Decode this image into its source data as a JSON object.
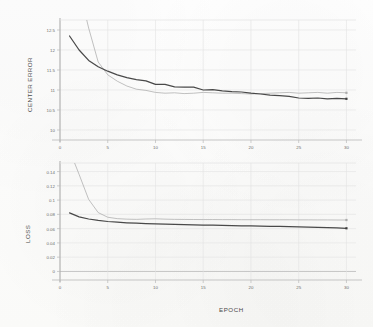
{
  "figure": {
    "background_color": "#fdfdfc",
    "grid_color": "#e3e3e3",
    "axis_color": "#b9b9b9",
    "series_colors": {
      "dark": "#3a3a3a",
      "light": "#a9a9a9"
    }
  },
  "top_chart": {
    "ylabel": "CENTER ERROR",
    "xlabel": "EPOCH",
    "ytick_labels": [
      "12.5",
      "12",
      "11.5",
      "11",
      "10.5",
      "10"
    ],
    "xtick_labels": [
      "0",
      "5",
      "10",
      "15",
      "20",
      "25",
      "30"
    ]
  },
  "bottom_chart": {
    "ylabel": "LOSS",
    "xlabel": "EPOCH",
    "ytick_labels": [
      "0.14",
      "0.12",
      "0.1",
      "0.08",
      "0.06",
      "0.04",
      "0.02",
      "0"
    ],
    "xtick_labels": [
      "0",
      "5",
      "10",
      "15",
      "20",
      "25",
      "30"
    ]
  },
  "chart_data": [
    {
      "type": "line",
      "title": "",
      "xlabel": "EPOCH",
      "ylabel": "CENTER ERROR",
      "xlim": [
        0,
        31
      ],
      "ylim": [
        9.75,
        12.75
      ],
      "yticks": [
        10,
        10.5,
        11,
        11.5,
        12,
        12.5
      ],
      "xticks": [
        0,
        5,
        10,
        15,
        20,
        25,
        30
      ],
      "grid": true,
      "legend": "none",
      "clipped_above": true,
      "x": [
        1,
        2,
        3,
        4,
        5,
        6,
        7,
        8,
        9,
        10,
        11,
        12,
        13,
        14,
        15,
        16,
        17,
        18,
        19,
        20,
        21,
        22,
        23,
        24,
        25,
        26,
        27,
        28,
        29,
        30
      ],
      "series": [
        {
          "name": "dark",
          "color": "#3a3a3a",
          "marker_at_end": true,
          "values": [
            12.35,
            12.0,
            11.74,
            11.58,
            11.47,
            11.38,
            11.31,
            11.26,
            11.23,
            11.14,
            11.14,
            11.08,
            11.07,
            11.07,
            11.0,
            11.01,
            10.98,
            10.96,
            10.95,
            10.92,
            10.9,
            10.87,
            10.86,
            10.84,
            10.8,
            10.79,
            10.8,
            10.78,
            10.79,
            10.78
          ]
        },
        {
          "name": "light",
          "color": "#a9a9a9",
          "marker_at_end": true,
          "values": [
            14.6,
            13.55,
            12.55,
            11.7,
            11.38,
            11.22,
            11.1,
            11.02,
            10.99,
            10.94,
            10.92,
            10.93,
            10.91,
            10.92,
            10.94,
            10.93,
            10.92,
            10.92,
            10.91,
            10.9,
            10.91,
            10.92,
            10.93,
            10.94,
            10.92,
            10.93,
            10.94,
            10.92,
            10.94,
            10.93
          ]
        }
      ]
    },
    {
      "type": "line",
      "title": "",
      "xlabel": "EPOCH",
      "ylabel": "LOSS",
      "xlim": [
        0,
        31
      ],
      "ylim": [
        -0.012,
        0.152
      ],
      "yticks": [
        0,
        0.02,
        0.04,
        0.06,
        0.08,
        0.1,
        0.12,
        0.14
      ],
      "xticks": [
        0,
        5,
        10,
        15,
        20,
        25,
        30
      ],
      "grid": true,
      "legend": "none",
      "clipped_above": true,
      "x": [
        1,
        2,
        3,
        4,
        5,
        6,
        7,
        8,
        9,
        10,
        11,
        12,
        13,
        14,
        15,
        16,
        17,
        18,
        19,
        20,
        21,
        22,
        23,
        24,
        25,
        26,
        27,
        28,
        29,
        30
      ],
      "series": [
        {
          "name": "dark",
          "color": "#3a3a3a",
          "marker_at_end": true,
          "values": [
            0.082,
            0.0765,
            0.0735,
            0.0715,
            0.07,
            0.069,
            0.0682,
            0.0676,
            0.067,
            0.0666,
            0.0662,
            0.0659,
            0.0656,
            0.0653,
            0.065,
            0.0648,
            0.0645,
            0.0643,
            0.064,
            0.0638,
            0.0635,
            0.0632,
            0.063,
            0.0627,
            0.0624,
            0.062,
            0.0617,
            0.0613,
            0.0609,
            0.0605
          ]
        },
        {
          "name": "light",
          "color": "#a9a9a9",
          "marker_at_end": true,
          "values": [
            0.17,
            0.136,
            0.101,
            0.0825,
            0.076,
            0.074,
            0.0733,
            0.073,
            0.0735,
            0.0738,
            0.0733,
            0.073,
            0.0729,
            0.0728,
            0.0727,
            0.0727,
            0.0726,
            0.0726,
            0.0725,
            0.0725,
            0.0725,
            0.0724,
            0.0724,
            0.0724,
            0.0723,
            0.0723,
            0.0722,
            0.0722,
            0.0721,
            0.0721
          ]
        }
      ]
    }
  ]
}
